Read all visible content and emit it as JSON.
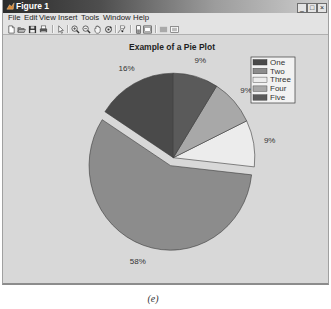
{
  "window": {
    "title": "Figure 1",
    "controls": {
      "minimize": "_",
      "maximize": "□",
      "close": "×"
    }
  },
  "menu": {
    "items": [
      "File",
      "Edit",
      "View",
      "Insert",
      "Tools",
      "Window",
      "Help"
    ]
  },
  "toolbar": {
    "items": [
      "new-figure-icon",
      "open-file-icon",
      "save-icon",
      "print-icon",
      "edit-plot-pointer-icon",
      "zoom-in-icon",
      "zoom-out-icon",
      "pan-hand-icon",
      "rotate-3d-icon",
      "data-cursor-icon",
      "insert-colorbar-icon",
      "insert-legend-icon",
      "hide-plot-tools-icon",
      "show-plot-tools-icon"
    ]
  },
  "figure": {
    "caption": "(e)"
  },
  "chart_data": {
    "type": "pie",
    "title": "Example of a Pie Plot",
    "categories": [
      "One",
      "Two",
      "Three",
      "Four",
      "Five"
    ],
    "values": [
      16,
      58,
      9,
      9,
      9
    ],
    "labels": [
      "16%",
      "58%",
      "9%",
      "9%",
      "9%"
    ],
    "explode": [
      0,
      1,
      0,
      0,
      0
    ],
    "colors": [
      "#4a4a4a",
      "#8c8c8c",
      "#ececec",
      "#a8a8a8",
      "#5a5a5a"
    ],
    "start_angle_deg": 90,
    "direction": "counterclockwise",
    "legend": {
      "position": "northeast",
      "entries": [
        "One",
        "Two",
        "Three",
        "Four",
        "Five"
      ]
    },
    "xlabel": "",
    "ylabel": ""
  }
}
